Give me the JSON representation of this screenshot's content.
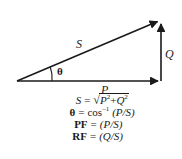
{
  "diagram": {
    "line_color": "#1a1a1a",
    "background_color": "#ffffff",
    "labels": {
      "hypotenuse": "S",
      "vertical": "Q",
      "horizontal": "P",
      "angle": "θ"
    },
    "vertices": {
      "origin": [
        17,
        81
      ],
      "apex": [
        161,
        20
      ],
      "right_angle": [
        161,
        81
      ]
    }
  },
  "formulas": [
    {
      "id": "apparent-power",
      "lhs": "S",
      "lhs_style": "italic",
      "eq": "=",
      "radical_sign": "√",
      "radicand_base1": "P",
      "radicand_exp1": "2",
      "radicand_op": "+",
      "radicand_base2": "Q",
      "radicand_exp2": "2",
      "text": "S = √(P² + Q²)"
    },
    {
      "id": "phase-angle",
      "lhs": "θ",
      "lhs_style": "upright",
      "eq": "=",
      "fn": "cos",
      "fn_exp": "–1",
      "arg": "(P/S)",
      "text": "θ = cos–1 (P/S)"
    },
    {
      "id": "power-factor",
      "lhs": "PF",
      "lhs_style": "upright",
      "eq": "=",
      "arg": "(P/S)",
      "text": "PF = (P/S)"
    },
    {
      "id": "reactive-factor",
      "lhs": "RF",
      "lhs_style": "upright",
      "eq": "=",
      "arg": "(Q/S)",
      "text": "RF = (Q/S)"
    }
  ]
}
